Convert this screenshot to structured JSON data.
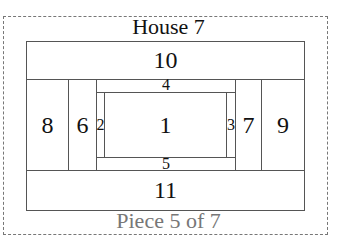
{
  "title": "House 7",
  "footer": "Piece 5 of 7",
  "pieces": {
    "p1": "1",
    "p2": "2",
    "p3": "3",
    "p4": "4",
    "p5": "5",
    "p6": "6",
    "p7": "7",
    "p8": "8",
    "p9": "9",
    "p10": "10",
    "p11": "11"
  },
  "colors": {
    "border": "#555555",
    "dashed": "#777777",
    "footer_text": "#777777"
  }
}
